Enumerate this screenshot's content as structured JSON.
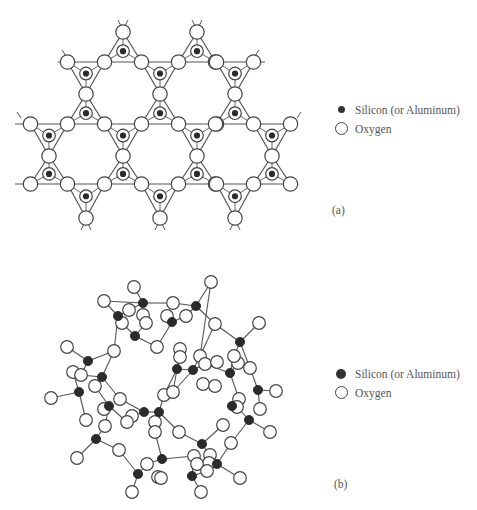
{
  "figure": {
    "panel_a": {
      "label": "(a)",
      "description": "Planar sheet of corner-sharing SiO4 tetrahedra (top view)",
      "legend": [
        {
          "symbol": "filled-dot",
          "text": "Silicon (or Aluminum)"
        },
        {
          "symbol": "open-circle",
          "text": "Oxygen"
        }
      ]
    },
    "panel_b": {
      "label": "(b)",
      "description": "Zeolite cage framework of Si/Al and O atoms",
      "legend": [
        {
          "symbol": "filled-dot",
          "text": "Silicon (or Aluminum)"
        },
        {
          "symbol": "open-circle",
          "text": "Oxygen"
        }
      ]
    },
    "colors": {
      "atom_fill_si": "#2b2b2b",
      "atom_fill_o": "#ffffff",
      "atom_stroke": "#444444",
      "bond": "#555555",
      "text": "#555555"
    }
  }
}
